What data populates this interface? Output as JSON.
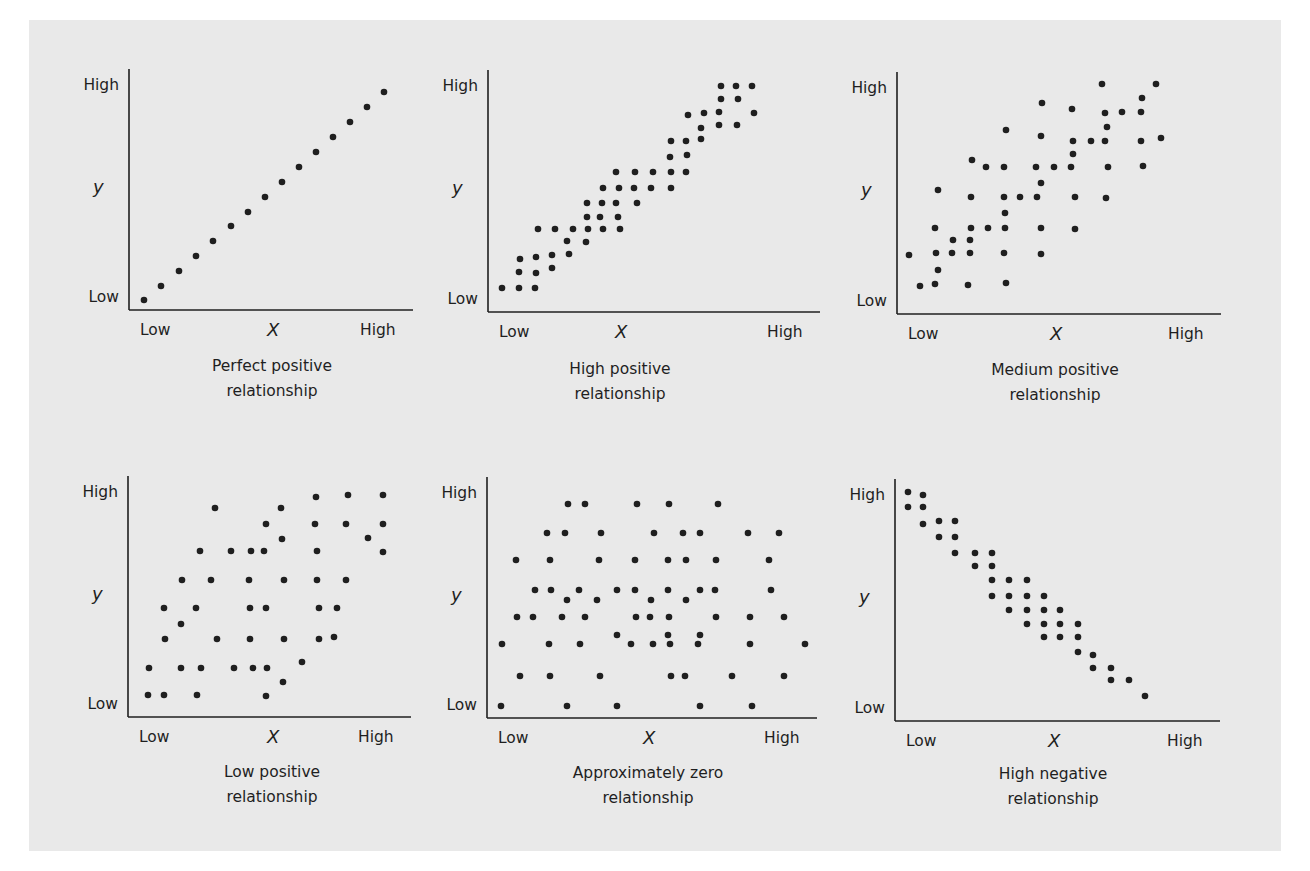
{
  "chart_data": [
    {
      "type": "scatter",
      "title": "Perfect positive relationship",
      "xlabel": "X",
      "ylabel": "y",
      "x_ticks": [
        "Low",
        "High"
      ],
      "y_ticks": [
        "Low",
        "High"
      ],
      "grid": false,
      "points": [
        [
          144,
          300
        ],
        [
          161,
          286
        ],
        [
          179,
          271
        ],
        [
          196,
          256
        ],
        [
          213,
          241
        ],
        [
          231,
          226
        ],
        [
          248,
          212
        ],
        [
          265,
          197
        ],
        [
          282,
          182
        ],
        [
          299,
          167
        ],
        [
          316,
          152
        ],
        [
          333,
          137
        ],
        [
          350,
          122
        ],
        [
          367,
          107
        ],
        [
          384,
          92
        ]
      ]
    },
    {
      "type": "scatter",
      "title": "High positive relationship",
      "xlabel": "X",
      "ylabel": "y",
      "x_ticks": [
        "Low",
        "High"
      ],
      "y_ticks": [
        "Low",
        "High"
      ],
      "grid": false,
      "points": [
        [
          502,
          288
        ],
        [
          519,
          288
        ],
        [
          535,
          288
        ],
        [
          519,
          272
        ],
        [
          536,
          273
        ],
        [
          520,
          259
        ],
        [
          536,
          257
        ],
        [
          552,
          268
        ],
        [
          552,
          255
        ],
        [
          569,
          254
        ],
        [
          567,
          241
        ],
        [
          586,
          242
        ],
        [
          538,
          229
        ],
        [
          555,
          229
        ],
        [
          573,
          229
        ],
        [
          588,
          229
        ],
        [
          603,
          229
        ],
        [
          620,
          229
        ],
        [
          587,
          217
        ],
        [
          600,
          217
        ],
        [
          618,
          217
        ],
        [
          587,
          203
        ],
        [
          602,
          203
        ],
        [
          616,
          203
        ],
        [
          637,
          203
        ],
        [
          603,
          188
        ],
        [
          619,
          188
        ],
        [
          634,
          188
        ],
        [
          651,
          188
        ],
        [
          671,
          188
        ],
        [
          616,
          172
        ],
        [
          635,
          172
        ],
        [
          653,
          172
        ],
        [
          671,
          172
        ],
        [
          686,
          172
        ],
        [
          670,
          157
        ],
        [
          687,
          155
        ],
        [
          671,
          141
        ],
        [
          686,
          141
        ],
        [
          701,
          139
        ],
        [
          701,
          128
        ],
        [
          719,
          125
        ],
        [
          737,
          125
        ],
        [
          688,
          115
        ],
        [
          704,
          113
        ],
        [
          719,
          112
        ],
        [
          754,
          113
        ],
        [
          721,
          99
        ],
        [
          738,
          99
        ],
        [
          721,
          86
        ],
        [
          736,
          86
        ],
        [
          752,
          86
        ]
      ]
    },
    {
      "type": "scatter",
      "title": "Medium positive relationship",
      "xlabel": "X",
      "ylabel": "y",
      "x_ticks": [
        "Low",
        "High"
      ],
      "y_ticks": [
        "Low",
        "High"
      ],
      "grid": false,
      "points": [
        [
          1102,
          84
        ],
        [
          1156,
          84
        ],
        [
          1042,
          103
        ],
        [
          1072,
          109
        ],
        [
          1142,
          98
        ],
        [
          1105,
          113
        ],
        [
          1122,
          112
        ],
        [
          1141,
          112
        ],
        [
          1006,
          130
        ],
        [
          1107,
          127
        ],
        [
          1041,
          136
        ],
        [
          1073,
          141
        ],
        [
          1091,
          141
        ],
        [
          1105,
          141
        ],
        [
          1141,
          141
        ],
        [
          1161,
          138
        ],
        [
          1073,
          154
        ],
        [
          972,
          160
        ],
        [
          986,
          167
        ],
        [
          1004,
          167
        ],
        [
          1036,
          167
        ],
        [
          1054,
          167
        ],
        [
          1071,
          167
        ],
        [
          1108,
          167
        ],
        [
          1143,
          166
        ],
        [
          1041,
          183
        ],
        [
          938,
          190
        ],
        [
          971,
          197
        ],
        [
          1004,
          197
        ],
        [
          1020,
          197
        ],
        [
          1037,
          197
        ],
        [
          1075,
          197
        ],
        [
          1106,
          198
        ],
        [
          1005,
          213
        ],
        [
          935,
          228
        ],
        [
          971,
          228
        ],
        [
          988,
          228
        ],
        [
          1005,
          228
        ],
        [
          1041,
          228
        ],
        [
          1075,
          229
        ],
        [
          953,
          240
        ],
        [
          970,
          240
        ],
        [
          909,
          255
        ],
        [
          936,
          253
        ],
        [
          952,
          253
        ],
        [
          970,
          253
        ],
        [
          1004,
          253
        ],
        [
          1041,
          254
        ],
        [
          938,
          270
        ],
        [
          920,
          286
        ],
        [
          935,
          284
        ],
        [
          968,
          285
        ],
        [
          1006,
          283
        ]
      ]
    },
    {
      "type": "scatter",
      "title": "Low positive relationship",
      "xlabel": "X",
      "ylabel": "y",
      "x_ticks": [
        "Low",
        "High"
      ],
      "y_ticks": [
        "Low",
        "High"
      ],
      "grid": false,
      "points": [
        [
          316,
          497
        ],
        [
          348,
          495
        ],
        [
          383,
          495
        ],
        [
          215,
          508
        ],
        [
          281,
          508
        ],
        [
          266,
          524
        ],
        [
          315,
          524
        ],
        [
          346,
          524
        ],
        [
          383,
          524
        ],
        [
          282,
          539
        ],
        [
          368,
          538
        ],
        [
          383,
          552
        ],
        [
          200,
          551
        ],
        [
          231,
          551
        ],
        [
          251,
          551
        ],
        [
          264,
          551
        ],
        [
          317,
          551
        ],
        [
          182,
          580
        ],
        [
          211,
          580
        ],
        [
          249,
          580
        ],
        [
          284,
          580
        ],
        [
          317,
          580
        ],
        [
          346,
          580
        ],
        [
          164,
          608
        ],
        [
          196,
          608
        ],
        [
          250,
          608
        ],
        [
          266,
          608
        ],
        [
          319,
          608
        ],
        [
          337,
          608
        ],
        [
          181,
          624
        ],
        [
          165,
          639
        ],
        [
          217,
          639
        ],
        [
          250,
          639
        ],
        [
          284,
          639
        ],
        [
          319,
          639
        ],
        [
          334,
          637
        ],
        [
          149,
          668
        ],
        [
          181,
          668
        ],
        [
          201,
          668
        ],
        [
          234,
          668
        ],
        [
          253,
          668
        ],
        [
          267,
          668
        ],
        [
          302,
          662
        ],
        [
          283,
          682
        ],
        [
          148,
          695
        ],
        [
          164,
          695
        ],
        [
          197,
          695
        ],
        [
          266,
          696
        ]
      ]
    },
    {
      "type": "scatter",
      "title": "Approximately zero relationship",
      "xlabel": "X",
      "ylabel": "y",
      "x_ticks": [
        "Low",
        "High"
      ],
      "y_ticks": [
        "Low",
        "High"
      ],
      "grid": false,
      "points": [
        [
          568,
          504
        ],
        [
          585,
          504
        ],
        [
          637,
          504
        ],
        [
          669,
          504
        ],
        [
          718,
          504
        ],
        [
          547,
          533
        ],
        [
          565,
          533
        ],
        [
          601,
          533
        ],
        [
          654,
          533
        ],
        [
          683,
          533
        ],
        [
          700,
          533
        ],
        [
          748,
          533
        ],
        [
          779,
          533
        ],
        [
          516,
          560
        ],
        [
          550,
          560
        ],
        [
          599,
          560
        ],
        [
          635,
          560
        ],
        [
          668,
          560
        ],
        [
          686,
          560
        ],
        [
          716,
          560
        ],
        [
          769,
          560
        ],
        [
          535,
          590
        ],
        [
          551,
          590
        ],
        [
          579,
          590
        ],
        [
          617,
          590
        ],
        [
          635,
          590
        ],
        [
          668,
          590
        ],
        [
          700,
          590
        ],
        [
          715,
          590
        ],
        [
          771,
          590
        ],
        [
          567,
          600
        ],
        [
          597,
          600
        ],
        [
          651,
          600
        ],
        [
          686,
          600
        ],
        [
          517,
          617
        ],
        [
          533,
          617
        ],
        [
          562,
          617
        ],
        [
          585,
          617
        ],
        [
          636,
          617
        ],
        [
          650,
          617
        ],
        [
          669,
          617
        ],
        [
          716,
          617
        ],
        [
          750,
          617
        ],
        [
          784,
          617
        ],
        [
          617,
          635
        ],
        [
          668,
          635
        ],
        [
          700,
          635
        ],
        [
          502,
          644
        ],
        [
          549,
          644
        ],
        [
          580,
          644
        ],
        [
          631,
          644
        ],
        [
          653,
          644
        ],
        [
          670,
          644
        ],
        [
          698,
          644
        ],
        [
          750,
          644
        ],
        [
          805,
          644
        ],
        [
          520,
          676
        ],
        [
          550,
          676
        ],
        [
          600,
          676
        ],
        [
          671,
          676
        ],
        [
          685,
          676
        ],
        [
          732,
          676
        ],
        [
          784,
          676
        ],
        [
          501,
          706
        ],
        [
          567,
          706
        ],
        [
          617,
          706
        ],
        [
          700,
          706
        ],
        [
          752,
          706
        ]
      ]
    },
    {
      "type": "scatter",
      "title": "High negative relationship",
      "xlabel": "X",
      "ylabel": "y",
      "x_ticks": [
        "Low",
        "High"
      ],
      "y_ticks": [
        "Low",
        "High"
      ],
      "grid": false,
      "points": [
        [
          908,
          492
        ],
        [
          923,
          495
        ],
        [
          908,
          507
        ],
        [
          923,
          507
        ],
        [
          923,
          524
        ],
        [
          939,
          521
        ],
        [
          955,
          521
        ],
        [
          939,
          537
        ],
        [
          955,
          537
        ],
        [
          955,
          553
        ],
        [
          975,
          553
        ],
        [
          992,
          553
        ],
        [
          975,
          566
        ],
        [
          992,
          566
        ],
        [
          992,
          580
        ],
        [
          1009,
          580
        ],
        [
          1027,
          580
        ],
        [
          992,
          596
        ],
        [
          1009,
          596
        ],
        [
          1027,
          596
        ],
        [
          1044,
          596
        ],
        [
          1009,
          610
        ],
        [
          1027,
          610
        ],
        [
          1044,
          610
        ],
        [
          1060,
          610
        ],
        [
          1027,
          624
        ],
        [
          1044,
          624
        ],
        [
          1060,
          624
        ],
        [
          1078,
          624
        ],
        [
          1044,
          637
        ],
        [
          1060,
          637
        ],
        [
          1078,
          637
        ],
        [
          1078,
          652
        ],
        [
          1093,
          655
        ],
        [
          1093,
          668
        ],
        [
          1111,
          668
        ],
        [
          1111,
          680
        ],
        [
          1129,
          680
        ],
        [
          1145,
          696
        ]
      ]
    }
  ],
  "panels": [
    {
      "title_line1": "Perfect positive",
      "title_line2": "relationship",
      "y_high": "High",
      "y_low": "Low",
      "y_var": "y",
      "x_low": "Low",
      "x_var": "X",
      "x_high": "High"
    },
    {
      "title_line1": "High positive",
      "title_line2": "relationship",
      "y_high": "High",
      "y_low": "Low",
      "y_var": "y",
      "x_low": "Low",
      "x_var": "X",
      "x_high": "High"
    },
    {
      "title_line1": "Medium positive",
      "title_line2": "relationship",
      "y_high": "High",
      "y_low": "Low",
      "y_var": "y",
      "x_low": "Low",
      "x_var": "X",
      "x_high": "High"
    },
    {
      "title_line1": "Low positive",
      "title_line2": "relationship",
      "y_high": "High",
      "y_low": "Low",
      "y_var": "y",
      "x_low": "Low",
      "x_var": "X",
      "x_high": "High"
    },
    {
      "title_line1": "Approximately zero",
      "title_line2": "relationship",
      "y_high": "High",
      "y_low": "Low",
      "y_var": "y",
      "x_low": "Low",
      "x_var": "X",
      "x_high": "High"
    },
    {
      "title_line1": "High negative",
      "title_line2": "relationship",
      "y_high": "High",
      "y_low": "Low",
      "y_var": "y",
      "x_low": "Low",
      "x_var": "X",
      "x_high": "High"
    }
  ],
  "colors": {
    "background": "#e9e9e9",
    "ink": "#1f1f1f"
  }
}
